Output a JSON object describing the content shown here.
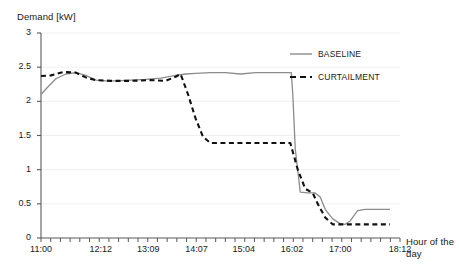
{
  "chart_data": {
    "type": "line",
    "title": "",
    "ylabel": "Demand [kW]",
    "xlabel": "Hour of the day",
    "ylim": [
      0,
      3
    ],
    "xlim": [
      11.0,
      18.2
    ],
    "grid": true,
    "grid_axis": "y",
    "legend_position": "top-right",
    "ytick_labels": [
      "0",
      "0.5",
      "1",
      "1.5",
      "2",
      "2.5",
      "3"
    ],
    "ytick_values": [
      0,
      0.5,
      1,
      1.5,
      2,
      2.5,
      3
    ],
    "xtick_labels": [
      "11:00",
      "12:12",
      "13:09",
      "14:07",
      "15:04",
      "16:02",
      "17:00",
      "18:12"
    ],
    "xtick_values": [
      11.0,
      12.2,
      13.15,
      14.117,
      15.067,
      16.033,
      17.0,
      18.2
    ],
    "series": [
      {
        "name": "BASELINE",
        "style": "solid",
        "color": "#8c8c8c",
        "x": [
          11.0,
          11.15,
          11.3,
          11.5,
          11.7,
          11.9,
          12.1,
          12.3,
          12.5,
          12.8,
          13.1,
          13.4,
          13.7,
          13.9,
          14.1,
          14.4,
          14.7,
          15.0,
          15.3,
          15.6,
          15.9,
          16.02,
          16.05,
          16.1,
          16.2,
          16.35,
          16.5,
          16.6,
          16.7,
          16.85,
          17.0,
          17.1,
          17.2,
          17.35,
          17.5,
          18.0
        ],
        "y": [
          2.1,
          2.22,
          2.33,
          2.4,
          2.42,
          2.38,
          2.31,
          2.3,
          2.3,
          2.31,
          2.32,
          2.34,
          2.38,
          2.4,
          2.41,
          2.42,
          2.42,
          2.4,
          2.42,
          2.42,
          2.42,
          2.42,
          2.1,
          1.3,
          0.67,
          0.66,
          0.66,
          0.6,
          0.42,
          0.28,
          0.21,
          0.2,
          0.25,
          0.4,
          0.42,
          0.42
        ]
      },
      {
        "name": "CURTAILMENT",
        "style": "dashed",
        "color": "#111111",
        "x": [
          11.0,
          11.2,
          11.45,
          11.7,
          11.9,
          12.1,
          12.4,
          12.8,
          13.2,
          13.5,
          13.7,
          13.8,
          13.95,
          14.1,
          14.25,
          14.4,
          15.0,
          15.5,
          15.9,
          16.0,
          16.15,
          16.3,
          16.45,
          16.55,
          16.7,
          16.85,
          17.0,
          17.5,
          18.0
        ],
        "y": [
          2.37,
          2.38,
          2.43,
          2.42,
          2.35,
          2.31,
          2.3,
          2.3,
          2.31,
          2.3,
          2.36,
          2.4,
          2.1,
          1.75,
          1.48,
          1.39,
          1.39,
          1.39,
          1.39,
          1.39,
          1.0,
          0.72,
          0.66,
          0.5,
          0.3,
          0.2,
          0.2,
          0.2,
          0.2
        ]
      }
    ]
  },
  "legend": {
    "baseline_label": "BASELINE",
    "curtailment_label": "CURTAILMENT"
  },
  "colors": {
    "baseline": "#8c8c8c",
    "curtailment": "#111111",
    "axis": "#595959",
    "grid": "#f0f0f0",
    "text": "#1a1a1a"
  }
}
